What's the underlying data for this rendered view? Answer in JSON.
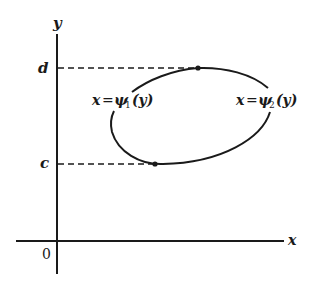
{
  "diagram": {
    "axes": {
      "x_label": "x",
      "y_label": "y",
      "origin_label": "0"
    },
    "ticks": {
      "d_label": "d",
      "c_label": "c"
    },
    "curve_labels": {
      "left": {
        "lhs": "x",
        "eq": "=",
        "func": "ψ",
        "sub": "1",
        "arg": "(y)"
      },
      "right": {
        "lhs": "x",
        "eq": "=",
        "func": "ψ",
        "sub": "2",
        "arg": "(y)"
      }
    },
    "colors": {
      "ink": "#1a1a1a",
      "background": "#ffffff"
    }
  }
}
